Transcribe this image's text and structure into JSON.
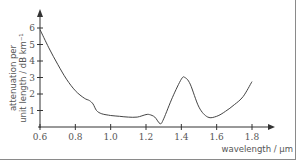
{
  "chart_data": {
    "type": "line",
    "title": "",
    "xlabel": "wavelength / μm",
    "ylabel_line1": "attenuation per",
    "ylabel_line2": "unit length / dB km⁻¹",
    "xlim": [
      0.6,
      1.8
    ],
    "ylim": [
      0,
      6
    ],
    "x_ticks": [
      "0.6",
      "0.8",
      "1.0",
      "1.2",
      "1.4",
      "1.6",
      "1.8"
    ],
    "y_ticks": [
      "1",
      "2",
      "3",
      "4",
      "5",
      "6"
    ],
    "grid": false,
    "legend": "none",
    "series": [
      {
        "name": "attenuation",
        "x": [
          0.6,
          0.65,
          0.7,
          0.75,
          0.8,
          0.85,
          0.88,
          0.9,
          0.92,
          0.95,
          1.0,
          1.05,
          1.1,
          1.15,
          1.2,
          1.22,
          1.25,
          1.28,
          1.3,
          1.35,
          1.4,
          1.42,
          1.45,
          1.5,
          1.55,
          1.6,
          1.65,
          1.7,
          1.75,
          1.8
        ],
        "values": [
          5.9,
          4.8,
          3.8,
          2.9,
          2.2,
          1.75,
          1.6,
          1.4,
          1.0,
          0.8,
          0.7,
          0.65,
          0.6,
          0.6,
          0.75,
          0.75,
          0.6,
          0.2,
          0.5,
          1.8,
          2.9,
          3.0,
          2.6,
          1.2,
          0.6,
          0.65,
          0.95,
          1.35,
          1.85,
          2.75
        ]
      }
    ]
  }
}
